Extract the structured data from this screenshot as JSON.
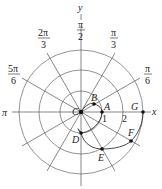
{
  "diagram": {
    "type": "polar-coordinate-plot",
    "axes": {
      "x_label": "x",
      "y_label": "y"
    },
    "angle_labels": [
      {
        "id": "pi",
        "num": "π",
        "den": ""
      },
      {
        "id": "5pi6",
        "num": "5π",
        "den": "6"
      },
      {
        "id": "2pi3",
        "num": "2π",
        "den": "3"
      },
      {
        "id": "pi2",
        "num": "π",
        "den": "2"
      },
      {
        "id": "pi3",
        "num": "π",
        "den": "3"
      },
      {
        "id": "pi6",
        "num": "π",
        "den": "6"
      }
    ],
    "radius_labels": [
      "1",
      "2"
    ],
    "points": [
      {
        "name": "A",
        "label": "A"
      },
      {
        "name": "B",
        "label": "B"
      },
      {
        "name": "C",
        "label": "C"
      },
      {
        "name": "D",
        "label": "D"
      },
      {
        "name": "E",
        "label": "E"
      },
      {
        "name": "F",
        "label": "F"
      },
      {
        "name": "G",
        "label": "G"
      }
    ],
    "colors": {
      "stroke": "#555555",
      "curve": "#333333",
      "point": "#111111"
    }
  }
}
